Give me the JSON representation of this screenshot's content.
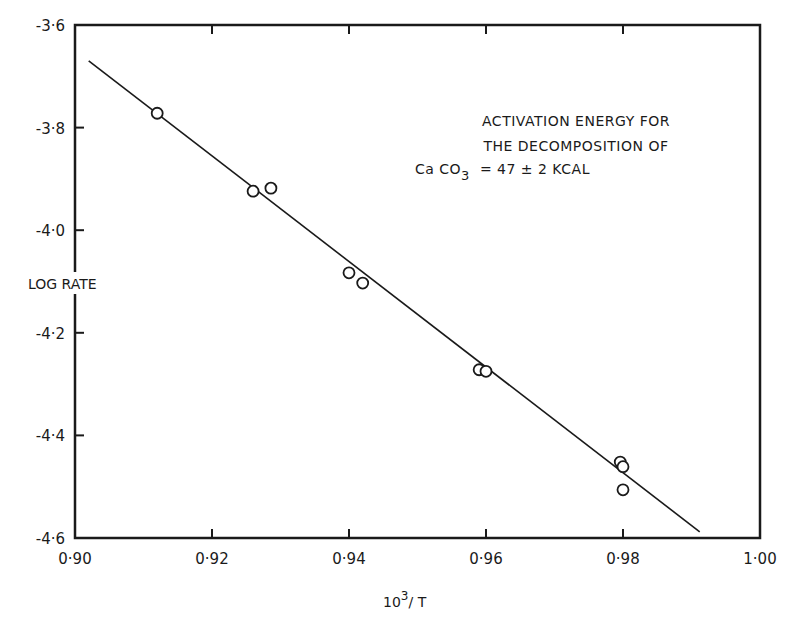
{
  "chart_data": {
    "type": "scatter",
    "title": "",
    "xlabel": "10³/T",
    "xlabel_base": "10",
    "xlabel_sup": "3",
    "xlabel_rest": "/ T",
    "ylabel": "LOG RATE",
    "xlim": [
      0.9,
      1.0
    ],
    "ylim": [
      -4.6,
      -3.6
    ],
    "grid": false,
    "legend": null,
    "x_ticks": [
      0.9,
      0.92,
      0.94,
      0.96,
      0.98,
      1.0
    ],
    "x_tick_labels": [
      "0·90",
      "0·92",
      "0·94",
      "0·96",
      "0·98",
      "1·00"
    ],
    "y_ticks": [
      -3.6,
      -3.8,
      -4.0,
      -4.2,
      -4.4,
      -4.6
    ],
    "y_tick_labels": [
      "-3·6",
      "-3·8",
      "-4·0",
      "-4·2",
      "-4·4",
      "-4·6"
    ],
    "series": [
      {
        "name": "measurements",
        "marker": "open-circle",
        "x": [
          0.912,
          0.926,
          0.9286,
          0.94,
          0.942,
          0.959,
          0.96,
          0.9796,
          0.98,
          0.98
        ],
        "y": [
          -3.772,
          -3.924,
          -3.918,
          -4.083,
          -4.103,
          -4.272,
          -4.275,
          -4.452,
          -4.461,
          -4.506
        ]
      },
      {
        "name": "fit-line",
        "marker": "line",
        "x": [
          0.902,
          0.9912
        ],
        "y": [
          -3.67,
          -4.588
        ]
      }
    ],
    "annotations": [
      "ACTIVATION ENERGY FOR",
      "THE DECOMPOSITION OF",
      "CaCO3 = 47 ± 2 KCAL"
    ],
    "annotation_parts": {
      "line1": "ACTIVATION ENERGY FOR",
      "line2": "THE DECOMPOSITION OF",
      "line3_formula": "Ca CO",
      "line3_sub": "3",
      "line3_rest": "=  47 ± 2  KCAL"
    }
  },
  "colors": {
    "ink": "#1a1a1a",
    "background": "#ffffff"
  }
}
